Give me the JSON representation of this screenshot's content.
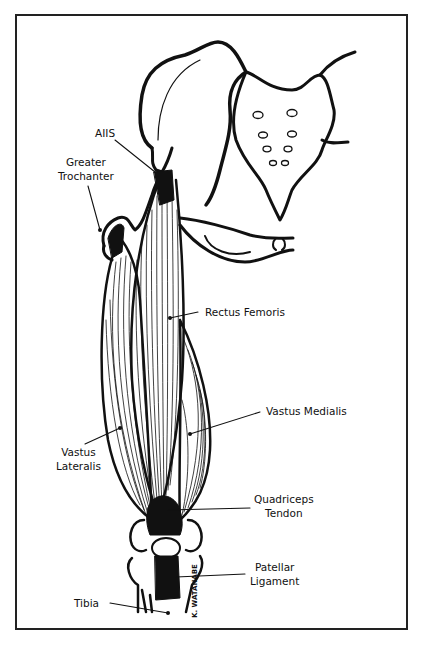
{
  "figure": {
    "type": "anatomical-illustration",
    "artist_signature": "K. WATANABE",
    "labels": [
      {
        "id": "aiis",
        "text": "AIIS"
      },
      {
        "id": "greater-trochanter",
        "lines": [
          "Greater",
          "Trochanter"
        ]
      },
      {
        "id": "rectus-femoris",
        "text": "Rectus Femoris"
      },
      {
        "id": "vastus-medialis",
        "text": "Vastus Medialis"
      },
      {
        "id": "vastus-lateralis",
        "lines": [
          "Vastus",
          "Lateralis"
        ]
      },
      {
        "id": "quadriceps-tendon",
        "lines": [
          "Quadriceps",
          "Tendon"
        ]
      },
      {
        "id": "patellar-ligament",
        "lines": [
          "Patellar",
          "Ligament"
        ]
      },
      {
        "id": "tibia",
        "text": "Tibia"
      }
    ],
    "colors": {
      "ink": "#111111",
      "background": "#ffffff",
      "caption": "#bbbbbb"
    }
  }
}
